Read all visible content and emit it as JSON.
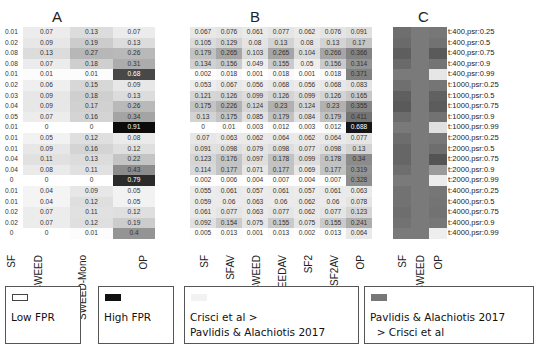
{
  "chart_data": [
    {
      "type": "heatmap",
      "title": "A",
      "columns": [
        "SF",
        "SWEED",
        "SWEED-Mono",
        "OP"
      ],
      "rows": [
        "t:400,psr:0.25",
        "t:400,psr:0.5",
        "t:400,psr:0.75",
        "t:400,psr:0.9",
        "t:400,psr:0.99",
        "t:1000,psr:0.25",
        "t:1000,psr:0.5",
        "t:1000,psr:0.75",
        "t:1000,psr:0.9",
        "t:1000,psr:0.99",
        "t:2000,psr:0.25",
        "t:2000,psr:0.5",
        "t:2000,psr:0.75",
        "t:2000,psr:0.9",
        "t:2000,psr:0.99",
        "t:4000,psr:0.25",
        "t:4000,psr:0.5",
        "t:4000,psr:0.75",
        "t:4000,psr:0.9",
        "t:4000,psr:0.99"
      ],
      "values": [
        [
          0.01,
          0.07,
          0.13,
          0.07
        ],
        [
          0.02,
          0.09,
          0.19,
          0.13
        ],
        [
          0.08,
          0.13,
          0.27,
          0.26
        ],
        [
          0.08,
          0.07,
          0.18,
          0.31
        ],
        [
          0.01,
          0.01,
          0.01,
          0.68
        ],
        [
          0.02,
          0.06,
          0.15,
          0.09
        ],
        [
          0.03,
          0.09,
          0.18,
          0.13
        ],
        [
          0.04,
          0.09,
          0.17,
          0.26
        ],
        [
          0.05,
          0.07,
          0.16,
          0.34
        ],
        [
          0.01,
          0,
          0,
          0.91
        ],
        [
          0.01,
          0.05,
          0.12,
          0.08
        ],
        [
          0.01,
          0.09,
          0.16,
          0.12
        ],
        [
          0.04,
          0.11,
          0.13,
          0.22
        ],
        [
          0.04,
          0.08,
          0.11,
          0.43
        ],
        [
          0,
          0,
          0,
          0.79
        ],
        [
          0.01,
          0.04,
          0.09,
          0.05
        ],
        [
          0.01,
          0.04,
          0.12,
          0.05
        ],
        [
          0.02,
          0.07,
          0.11,
          0.12
        ],
        [
          0.02,
          0.07,
          0.12,
          0.19
        ],
        [
          0,
          0,
          0.01,
          0.4
        ]
      ]
    },
    {
      "type": "heatmap",
      "title": "B",
      "columns": [
        "SF",
        "SFAV",
        "SWEED",
        "SWEEDAV",
        "SF2",
        "SF2AV",
        "OP"
      ],
      "values": [
        [
          0.067,
          0.076,
          0.061,
          0.077,
          0.062,
          0.076,
          0.091
        ],
        [
          0.105,
          0.129,
          0.08,
          0.13,
          0.08,
          0.13,
          0.17
        ],
        [
          0.179,
          0.265,
          0.103,
          0.265,
          0.104,
          0.266,
          0.366
        ],
        [
          0.134,
          0.156,
          0.049,
          0.155,
          0.05,
          0.156,
          0.314
        ],
        [
          0.002,
          0.018,
          0.001,
          0.018,
          0.001,
          0.018,
          0.371
        ],
        [
          0.053,
          0.067,
          0.056,
          0.068,
          0.056,
          0.068,
          0.083
        ],
        [
          0.121,
          0.126,
          0.099,
          0.126,
          0.099,
          0.126,
          0.165
        ],
        [
          0.175,
          0.226,
          0.124,
          0.23,
          0.124,
          0.23,
          0.355
        ],
        [
          0.13,
          0.175,
          0.085,
          0.179,
          0.084,
          0.179,
          0.411
        ],
        [
          0,
          0.01,
          0.003,
          0.012,
          0.003,
          0.012,
          0.688
        ],
        [
          0.07,
          0.063,
          0.062,
          0.064,
          0.062,
          0.064,
          0.077
        ],
        [
          0.091,
          0.098,
          0.079,
          0.098,
          0.077,
          0.098,
          0.13
        ],
        [
          0.123,
          0.176,
          0.097,
          0.178,
          0.099,
          0.178,
          0.34
        ],
        [
          0.114,
          0.177,
          0.071,
          0.177,
          0.069,
          0.177,
          0.319
        ],
        [
          0.002,
          0.006,
          0.004,
          0.007,
          0.004,
          0.007,
          0.328
        ],
        [
          0.055,
          0.061,
          0.057,
          0.061,
          0.057,
          0.061,
          0.063
        ],
        [
          0.059,
          0.06,
          0.063,
          0.06,
          0.062,
          0.06,
          0.078
        ],
        [
          0.061,
          0.077,
          0.063,
          0.077,
          0.062,
          0.077,
          0.123
        ],
        [
          0.092,
          0.154,
          0.075,
          0.155,
          0.075,
          0.155,
          0.241
        ],
        [
          0.005,
          0.013,
          0.001,
          0.013,
          0.002,
          0.013,
          0.064
        ]
      ]
    },
    {
      "type": "heatmap",
      "title": "C",
      "columns": [
        "SF",
        "SWEED",
        "OP"
      ],
      "comparison_grays": [
        [
          "#6e6e6e",
          "#7a7a7a",
          "#777777"
        ],
        [
          "#6a6a6a",
          "#7a7a7a",
          "#727272"
        ],
        [
          "#5e5e5e",
          "#7a7a7a",
          "#5a5a5a"
        ],
        [
          "#6a6a6a",
          "#7a7a7a",
          "#747474"
        ],
        [
          "#7a7a7a",
          "#7a7a7a",
          "#e6e6e6"
        ],
        [
          "#6f6f6f",
          "#7a7a7a",
          "#757575"
        ],
        [
          "#5f5f5f",
          "#7a7a7a",
          "#616161"
        ],
        [
          "#5a5a5a",
          "#7a7a7a",
          "#5c5c5c"
        ],
        [
          "#6c6c6c",
          "#7a7a7a",
          "#727272"
        ],
        [
          "#797979",
          "#7a7a7a",
          "#e0e0e0"
        ],
        [
          "#6d6d6d",
          "#7a7a7a",
          "#777777"
        ],
        [
          "#666666",
          "#7a7a7a",
          "#6e6e6e"
        ],
        [
          "#666666",
          "#7a7a7a",
          "#545454"
        ],
        [
          "#6e6e6e",
          "#7a7a7a",
          "#9a9a9a"
        ],
        [
          "#7a7a7a",
          "#7a7a7a",
          "#ececec"
        ],
        [
          "#727272",
          "#7a7a7a",
          "#767676"
        ],
        [
          "#727272",
          "#7a7a7a",
          "#747474"
        ],
        [
          "#6e6e6e",
          "#7a7a7a",
          "#727272"
        ],
        [
          "#727272",
          "#7a7a7a",
          "#777777"
        ],
        [
          "#7a7a7a",
          "#7a7a7a",
          "#eeeeee"
        ]
      ]
    }
  ],
  "panels": {
    "a_title": "A",
    "b_title": "B",
    "c_title": "C"
  },
  "legend": {
    "low_fpr": "Low FPR",
    "high_fpr": "High FPR",
    "crisci_better": "Crisci et al >\nPavlidis & Alachiotis 2017",
    "pavlidis_better": "Pavlidis & Alachiotis 2017\n  > Crisci et al"
  }
}
